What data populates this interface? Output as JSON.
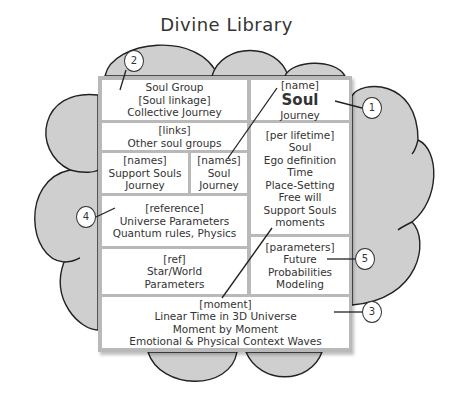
{
  "title": "Divine Library",
  "colors": {
    "cloud_fill": "#cfcfcf",
    "cloud_stroke": "#222222",
    "frame": "#b9b9b9",
    "cell_bg": "#ffffff",
    "text": "#333333"
  },
  "cells": {
    "soul_group": {
      "lines": [
        "Soul Group",
        "[Soul linkage]",
        "Collective Journey"
      ]
    },
    "soul": {
      "tag": "[name]",
      "name": "Soul",
      "sub": "Journey"
    },
    "links": {
      "lines": [
        "[links]",
        "Other soul groups"
      ]
    },
    "support_souls": {
      "lines": [
        "[names]",
        "Support Souls",
        "Journey"
      ]
    },
    "soul_journey": {
      "lines": [
        "[names]",
        "Soul",
        "Journey"
      ]
    },
    "per_lifetime": {
      "lines": [
        "[per lifetime]",
        "Soul",
        "Ego definition",
        "Time",
        "Place-Setting",
        "Free will",
        "Support Souls",
        "moments"
      ]
    },
    "reference": {
      "lines": [
        "[reference]",
        "Universe Parameters",
        "Quantum rules, Physics"
      ]
    },
    "star_world": {
      "lines": [
        "[ref]",
        "Star/World",
        "Parameters"
      ]
    },
    "parameters": {
      "lines": [
        "[parameters]",
        "Future",
        "Probabilities",
        "Modeling"
      ]
    },
    "moment": {
      "lines": [
        "[moment]",
        "Linear Time in 3D Universe",
        "Moment by Moment",
        "Emotional & Physical Context Waves"
      ]
    }
  },
  "callouts": [
    {
      "label": "1"
    },
    {
      "label": "2"
    },
    {
      "label": "3"
    },
    {
      "label": "4"
    },
    {
      "label": "5"
    }
  ]
}
